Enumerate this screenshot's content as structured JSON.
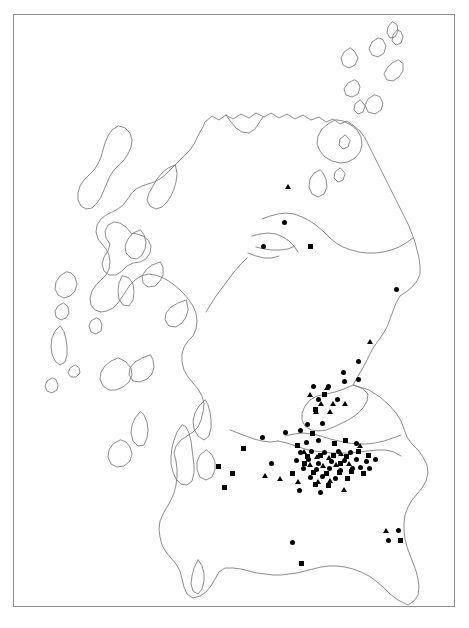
{
  "figure": {
    "frame": {
      "x": 13,
      "y": 14,
      "width": 442,
      "height": 593,
      "border_color": "#8d8d8d",
      "background_color": "#ffffff"
    },
    "coastline": {
      "stroke_color": "#6e6e6e",
      "stroke_width": 0.8,
      "fill": "none"
    }
  },
  "legend": {
    "visible": false,
    "symbol_types": [
      {
        "key": "circle",
        "label": "circle-marker",
        "color": "#000000",
        "size": 5
      },
      {
        "key": "square",
        "label": "square-marker",
        "color": "#000000",
        "size": 5
      },
      {
        "key": "triangle",
        "label": "triangle-marker",
        "color": "#000000",
        "size": 6
      }
    ]
  },
  "counts": {
    "circle": 48,
    "square": 30,
    "triangle": 25,
    "total": 103
  },
  "chart_data": {
    "type": "scatter",
    "xlabel": "",
    "ylabel": "",
    "xlim": [
      13,
      455
    ],
    "ylim": [
      14,
      607
    ],
    "grid": false,
    "legend_position": "none",
    "series": [
      {
        "name": "circle",
        "symbol": "circle",
        "color": "#000000",
        "points": [
          [
            284,
            222
          ],
          [
            263,
            246
          ],
          [
            396,
            289
          ],
          [
            358,
            361
          ],
          [
            343,
            372
          ],
          [
            358,
            379
          ],
          [
            313,
            386
          ],
          [
            328,
            386
          ],
          [
            344,
            381
          ],
          [
            318,
            399
          ],
          [
            337,
            399
          ],
          [
            285,
            432
          ],
          [
            300,
            430
          ],
          [
            307,
            424
          ],
          [
            322,
            423
          ],
          [
            262,
            437
          ],
          [
            306,
            442
          ],
          [
            318,
            440
          ],
          [
            300,
            452
          ],
          [
            311,
            451
          ],
          [
            324,
            452
          ],
          [
            338,
            451
          ],
          [
            350,
            452
          ],
          [
            296,
            460
          ],
          [
            308,
            459
          ],
          [
            318,
            463
          ],
          [
            331,
            461
          ],
          [
            344,
            460
          ],
          [
            356,
            459
          ],
          [
            366,
            461
          ],
          [
            375,
            459
          ],
          [
            303,
            468
          ],
          [
            316,
            469
          ],
          [
            329,
            468
          ],
          [
            340,
            470
          ],
          [
            352,
            468
          ],
          [
            360,
            467
          ],
          [
            369,
            468
          ],
          [
            310,
            477
          ],
          [
            322,
            476
          ],
          [
            335,
            478
          ],
          [
            299,
            490
          ],
          [
            320,
            492
          ],
          [
            292,
            542
          ],
          [
            398,
            530
          ],
          [
            388,
            540
          ],
          [
            271,
            463
          ],
          [
            356,
            443
          ]
        ]
      },
      {
        "name": "square",
        "symbol": "square",
        "color": "#000000",
        "points": [
          [
            310,
            246
          ],
          [
            324,
            394
          ],
          [
            315,
            409
          ],
          [
            243,
            448
          ],
          [
            218,
            466
          ],
          [
            232,
            473
          ],
          [
            224,
            487
          ],
          [
            307,
            456
          ],
          [
            320,
            455
          ],
          [
            333,
            455
          ],
          [
            346,
            456
          ],
          [
            313,
            472
          ],
          [
            326,
            473
          ],
          [
            339,
            472
          ],
          [
            351,
            471
          ],
          [
            363,
            473
          ],
          [
            304,
            463
          ],
          [
            358,
            451
          ],
          [
            315,
            484
          ],
          [
            328,
            485
          ],
          [
            301,
            563
          ],
          [
            400,
            540
          ],
          [
            297,
            445
          ],
          [
            312,
            433
          ],
          [
            340,
            463
          ],
          [
            347,
            478
          ],
          [
            368,
            455
          ],
          [
            292,
            473
          ],
          [
            334,
            443
          ],
          [
            345,
            440
          ]
        ]
      },
      {
        "name": "triangle",
        "symbol": "triangle",
        "color": "#000000",
        "points": [
          [
            288,
            186
          ],
          [
            370,
            341
          ],
          [
            327,
            387
          ],
          [
            310,
            394
          ],
          [
            321,
            403
          ],
          [
            333,
            403
          ],
          [
            345,
            403
          ],
          [
            316,
            411
          ],
          [
            330,
            411
          ],
          [
            265,
            475
          ],
          [
            280,
            478
          ],
          [
            304,
            451
          ],
          [
            317,
            456
          ],
          [
            329,
            457
          ],
          [
            341,
            453
          ],
          [
            310,
            464
          ],
          [
            323,
            465
          ],
          [
            336,
            464
          ],
          [
            349,
            463
          ],
          [
            318,
            481
          ],
          [
            330,
            480
          ],
          [
            344,
            489
          ],
          [
            386,
            530
          ],
          [
            360,
            445
          ],
          [
            298,
            481
          ]
        ]
      }
    ]
  }
}
